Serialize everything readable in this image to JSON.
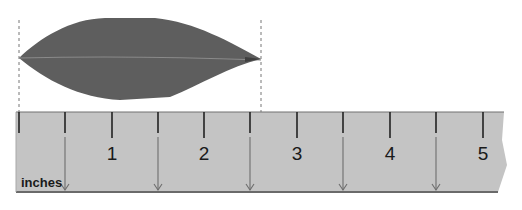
{
  "figure": {
    "units_label": "inches",
    "ruler": {
      "major_labels": [
        "1",
        "2",
        "3",
        "4",
        "5"
      ],
      "label_x": [
        112,
        204,
        297,
        390,
        483
      ],
      "tick_x": [
        19,
        65,
        112,
        158,
        204,
        250,
        297,
        343,
        390,
        436,
        483
      ],
      "arrow_x": [
        65,
        158,
        250,
        343,
        436
      ],
      "fill_color": "#c4c4c4",
      "edge_color": "#707070"
    },
    "leaf": {
      "start_x": 19,
      "end_x": 261,
      "color": "#5e5e5e"
    },
    "guide_lines": {
      "x": [
        19,
        261
      ],
      "style": "dashed"
    }
  }
}
